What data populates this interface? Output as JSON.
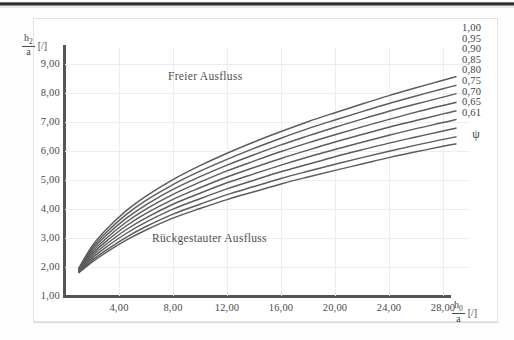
{
  "figure": {
    "annotations": {
      "upper_region": "Freier Ausfluss",
      "lower_region": "Rückgestauter Ausfluss"
    },
    "legend_symbol": "ψ"
  },
  "chart_data": {
    "type": "line",
    "title": "",
    "xlabel_numerator": "h",
    "xlabel_numerator_sub": "0",
    "xlabel_denominator": "a",
    "xlabel_unit": "[/]",
    "ylabel_numerator": "h",
    "ylabel_numerator_sub": "2",
    "ylabel_denominator": "a",
    "ylabel_unit": "[/]",
    "xlim": [
      0,
      30
    ],
    "ylim": [
      1,
      9.6
    ],
    "grid": true,
    "legend_position": "right",
    "xticks": [
      4,
      8,
      12,
      16,
      20,
      24,
      28
    ],
    "xtick_labels": [
      "4,00",
      "8,00",
      "12,00",
      "16,00",
      "20,00",
      "24,00",
      "28,00"
    ],
    "yticks": [
      1,
      2,
      3,
      4,
      5,
      6,
      7,
      8,
      9
    ],
    "ytick_labels": [
      "1,00",
      "2,00",
      "3,00",
      "4,00",
      "5,00",
      "6,00",
      "7,00",
      "8,00",
      "9,00"
    ],
    "series": [
      {
        "name": "1,00",
        "x": [
          1.0,
          2.0,
          3.0,
          4.5,
          6.0,
          8.0,
          10.0,
          12.0,
          14.0,
          16.0,
          18.0,
          20.0,
          22.0,
          24.0,
          26.0,
          28.0,
          29.0
        ],
        "values": [
          1.95,
          2.72,
          3.27,
          3.93,
          4.45,
          5.02,
          5.5,
          5.93,
          6.32,
          6.68,
          7.02,
          7.33,
          7.63,
          7.92,
          8.19,
          8.45,
          8.58
        ]
      },
      {
        "name": "0,95",
        "x": [
          1.0,
          2.0,
          3.0,
          4.5,
          6.0,
          8.0,
          10.0,
          12.0,
          14.0,
          16.0,
          18.0,
          20.0,
          22.0,
          24.0,
          26.0,
          28.0,
          29.0
        ],
        "values": [
          1.93,
          2.65,
          3.17,
          3.8,
          4.3,
          4.85,
          5.31,
          5.72,
          6.1,
          6.45,
          6.78,
          7.08,
          7.37,
          7.65,
          7.91,
          8.16,
          8.28
        ]
      },
      {
        "name": "0,90",
        "x": [
          1.0,
          2.0,
          3.0,
          4.5,
          6.0,
          8.0,
          10.0,
          12.0,
          14.0,
          16.0,
          18.0,
          20.0,
          22.0,
          24.0,
          26.0,
          28.0,
          29.0
        ],
        "values": [
          1.91,
          2.58,
          3.07,
          3.67,
          4.15,
          4.68,
          5.12,
          5.52,
          5.88,
          6.22,
          6.53,
          6.83,
          7.11,
          7.38,
          7.63,
          7.87,
          7.99
        ]
      },
      {
        "name": "0,85",
        "x": [
          1.0,
          2.0,
          3.0,
          4.5,
          6.0,
          8.0,
          10.0,
          12.0,
          14.0,
          16.0,
          18.0,
          20.0,
          22.0,
          24.0,
          26.0,
          28.0,
          29.0
        ],
        "values": [
          1.89,
          2.51,
          2.97,
          3.54,
          4.0,
          4.51,
          4.93,
          5.32,
          5.66,
          5.99,
          6.29,
          6.57,
          6.84,
          7.1,
          7.35,
          7.58,
          7.69
        ]
      },
      {
        "name": "0,80",
        "x": [
          1.0,
          2.0,
          3.0,
          4.5,
          6.0,
          8.0,
          10.0,
          12.0,
          14.0,
          16.0,
          18.0,
          20.0,
          22.0,
          24.0,
          26.0,
          28.0,
          29.0
        ],
        "values": [
          1.87,
          2.44,
          2.87,
          3.41,
          3.85,
          4.34,
          4.74,
          5.11,
          5.44,
          5.75,
          6.04,
          6.32,
          6.58,
          6.83,
          7.06,
          7.29,
          7.4
        ]
      },
      {
        "name": "0,75",
        "x": [
          1.0,
          2.0,
          3.0,
          4.5,
          6.0,
          8.0,
          10.0,
          12.0,
          14.0,
          16.0,
          18.0,
          20.0,
          22.0,
          24.0,
          26.0,
          28.0,
          29.0
        ],
        "values": [
          1.85,
          2.37,
          2.77,
          3.28,
          3.7,
          4.17,
          4.55,
          4.91,
          5.22,
          5.52,
          5.8,
          6.06,
          6.31,
          6.55,
          6.78,
          6.99,
          7.1
        ]
      },
      {
        "name": "0,70",
        "x": [
          1.0,
          2.0,
          3.0,
          4.5,
          6.0,
          8.0,
          10.0,
          12.0,
          14.0,
          16.0,
          18.0,
          20.0,
          22.0,
          24.0,
          26.0,
          28.0,
          29.0
        ],
        "values": [
          1.83,
          2.3,
          2.67,
          3.15,
          3.55,
          4.0,
          4.36,
          4.7,
          5.0,
          5.29,
          5.55,
          5.81,
          6.05,
          6.28,
          6.49,
          6.7,
          6.8
        ]
      },
      {
        "name": "0,65",
        "x": [
          1.0,
          2.0,
          3.0,
          4.5,
          6.0,
          8.0,
          10.0,
          12.0,
          14.0,
          16.0,
          18.0,
          20.0,
          22.0,
          24.0,
          26.0,
          28.0,
          29.0
        ],
        "values": [
          1.81,
          2.23,
          2.57,
          3.02,
          3.4,
          3.83,
          4.17,
          4.5,
          4.78,
          5.06,
          5.31,
          5.55,
          5.78,
          6.0,
          6.21,
          6.41,
          6.5
        ]
      },
      {
        "name": "0,61",
        "x": [
          1.0,
          2.0,
          3.0,
          4.5,
          6.0,
          8.0,
          10.0,
          12.0,
          14.0,
          16.0,
          18.0,
          20.0,
          22.0,
          24.0,
          26.0,
          28.0,
          29.0
        ],
        "values": [
          1.79,
          2.17,
          2.49,
          2.92,
          3.28,
          3.69,
          4.02,
          4.33,
          4.6,
          4.87,
          5.11,
          5.34,
          5.56,
          5.78,
          5.98,
          6.17,
          6.26
        ]
      }
    ]
  }
}
